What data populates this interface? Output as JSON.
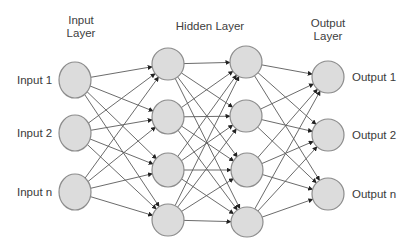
{
  "diagram": {
    "type": "neural-network",
    "colors": {
      "background": "#ffffff",
      "node_fill": "#dcdcdc",
      "node_stroke": "#8c8c8c",
      "edge": "#5a5a5a",
      "text": "#3a3a3a"
    },
    "layer_titles": [
      {
        "lines": [
          "Input",
          "Layer"
        ],
        "x": 81,
        "y": 24
      },
      {
        "lines": [
          "Hidden Layer"
        ],
        "x": 210,
        "y": 30
      },
      {
        "lines": [
          "Output",
          "Layer"
        ],
        "x": 328,
        "y": 27
      }
    ],
    "layers": [
      {
        "name": "input",
        "nodes": [
          {
            "id": "in1",
            "x": 75,
            "y": 80,
            "rx": 16,
            "ry": 18,
            "label": "Input 1"
          },
          {
            "id": "in2",
            "x": 75,
            "y": 133,
            "rx": 16,
            "ry": 18,
            "label": "Input 2"
          },
          {
            "id": "inN",
            "x": 75,
            "y": 192,
            "rx": 16,
            "ry": 18,
            "label": "Input n"
          }
        ]
      },
      {
        "name": "hidden-1",
        "nodes": [
          {
            "id": "h1a",
            "x": 168,
            "y": 64,
            "rx": 16,
            "ry": 16
          },
          {
            "id": "h1b",
            "x": 168,
            "y": 117,
            "rx": 16,
            "ry": 17
          },
          {
            "id": "h1c",
            "x": 168,
            "y": 170,
            "rx": 16,
            "ry": 17
          },
          {
            "id": "h1d",
            "x": 168,
            "y": 220,
            "rx": 16,
            "ry": 16
          }
        ]
      },
      {
        "name": "hidden-2",
        "nodes": [
          {
            "id": "h2a",
            "x": 246,
            "y": 62,
            "rx": 16,
            "ry": 16
          },
          {
            "id": "h2b",
            "x": 246,
            "y": 116,
            "rx": 16,
            "ry": 16
          },
          {
            "id": "h2c",
            "x": 247,
            "y": 170,
            "rx": 16,
            "ry": 17
          },
          {
            "id": "h2d",
            "x": 247,
            "y": 222,
            "rx": 16,
            "ry": 15
          }
        ]
      },
      {
        "name": "output",
        "nodes": [
          {
            "id": "out1",
            "x": 328,
            "y": 77,
            "rx": 16,
            "ry": 16,
            "label": "Output 1"
          },
          {
            "id": "out2",
            "x": 328,
            "y": 135,
            "rx": 16,
            "ry": 16,
            "label": "Output 2"
          },
          {
            "id": "outN",
            "x": 328,
            "y": 194,
            "rx": 16,
            "ry": 16,
            "label": "Output n"
          }
        ]
      }
    ],
    "connectivity": "fully-connected"
  }
}
